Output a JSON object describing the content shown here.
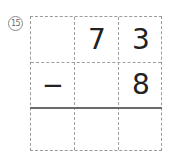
{
  "problem": {
    "number_label": "⑮",
    "rows": [
      [
        "",
        "7",
        "3"
      ],
      [
        "−",
        "",
        "8"
      ],
      [
        "",
        "",
        ""
      ]
    ]
  }
}
